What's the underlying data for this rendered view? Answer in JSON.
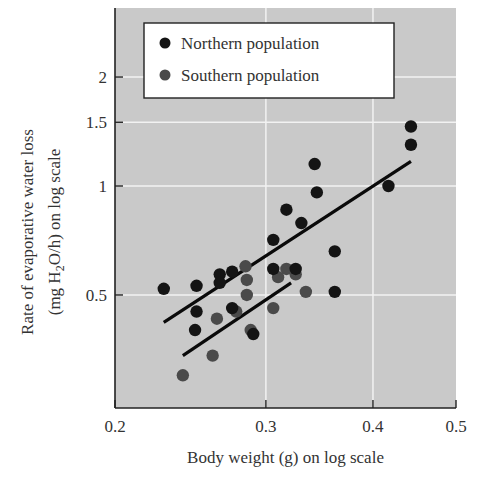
{
  "chart_data": {
    "type": "scatter",
    "title": "",
    "xlabel": "Body weight (g) on log scale",
    "ylabel_line1": "Rate of evaporative water loss",
    "ylabel_line2_prefix": "(mg H",
    "ylabel_line2_sub": "2",
    "ylabel_line2_suffix": "O/h) on log scale",
    "x_scale": "log",
    "y_scale": "log",
    "xlim": [
      0.2,
      0.5
    ],
    "ylim": [
      0.27,
      2.8
    ],
    "x_ticks": [
      0.2,
      0.3,
      0.4,
      0.5
    ],
    "x_tick_labels": [
      "0.2",
      "0.3",
      "0.4",
      "0.5"
    ],
    "y_ticks": [
      0.5,
      1,
      1.5,
      2
    ],
    "y_tick_labels": [
      "0.5",
      "1",
      "1.5",
      "2"
    ],
    "grid": true,
    "legend_position": "upper-left",
    "legend": [
      "Northern population",
      "Southern population"
    ],
    "series": [
      {
        "name": "Northern population",
        "color": "#141414",
        "points": [
          [
            0.228,
            0.52
          ],
          [
            0.249,
            0.53
          ],
          [
            0.249,
            0.45
          ],
          [
            0.248,
            0.4
          ],
          [
            0.265,
            0.57
          ],
          [
            0.265,
            0.54
          ],
          [
            0.274,
            0.58
          ],
          [
            0.274,
            0.46
          ],
          [
            0.29,
            0.39
          ],
          [
            0.306,
            0.71
          ],
          [
            0.306,
            0.59
          ],
          [
            0.317,
            0.86
          ],
          [
            0.325,
            0.59
          ],
          [
            0.33,
            0.79
          ],
          [
            0.342,
            1.15
          ],
          [
            0.344,
            0.96
          ],
          [
            0.361,
            0.66
          ],
          [
            0.361,
            0.51
          ],
          [
            0.417,
            1.0
          ],
          [
            0.443,
            1.3
          ],
          [
            0.443,
            1.46
          ]
        ],
        "fit_line": [
          [
            0.228,
            0.42
          ],
          [
            0.443,
            1.17
          ]
        ]
      },
      {
        "name": "Southern population",
        "color": "#4a4a4a",
        "points": [
          [
            0.24,
            0.3
          ],
          [
            0.26,
            0.34
          ],
          [
            0.263,
            0.43
          ],
          [
            0.277,
            0.45
          ],
          [
            0.284,
            0.6
          ],
          [
            0.285,
            0.55
          ],
          [
            0.285,
            0.5
          ],
          [
            0.288,
            0.4
          ],
          [
            0.306,
            0.46
          ],
          [
            0.31,
            0.56
          ],
          [
            0.317,
            0.59
          ],
          [
            0.325,
            0.57
          ],
          [
            0.334,
            0.51
          ]
        ],
        "fit_line": [
          [
            0.24,
            0.34
          ],
          [
            0.321,
            0.54
          ]
        ]
      }
    ]
  },
  "colors": {
    "plot_background": "#c9c9c9",
    "grid": "#f2f2f2",
    "axis": "#222222",
    "legend_background": "#ffffff"
  }
}
